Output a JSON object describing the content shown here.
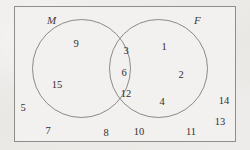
{
  "diagram": {
    "type": "venn-two-set",
    "background_color": "#eeecea",
    "paper_color": "#f3f1ef",
    "stroke_color": "#8a8a8a",
    "text_color": "#2f2f2f",
    "universal_set": {
      "shape": "rectangle",
      "label": ""
    },
    "sets": [
      {
        "id": "M",
        "label": "M",
        "position": "left",
        "label_placement": "outside-top-left"
      },
      {
        "id": "F",
        "label": "F",
        "position": "right",
        "label_placement": "outside-top-right"
      }
    ],
    "regions": {
      "m_only": {
        "name": "M only",
        "members": [
          "9",
          "15"
        ]
      },
      "intersection": {
        "name": "M and F",
        "members": [
          "3",
          "6",
          "12"
        ]
      },
      "f_only": {
        "name": "F only",
        "members": [
          "1",
          "2",
          "4"
        ]
      },
      "outside": {
        "name": "Neither M nor F",
        "members": [
          "5",
          "7",
          "8",
          "10",
          "11",
          "13",
          "14"
        ]
      }
    },
    "elements": [
      {
        "value": "9",
        "region": "m_only",
        "x": 76,
        "y": 44
      },
      {
        "value": "15",
        "region": "m_only",
        "x": 57,
        "y": 85
      },
      {
        "value": "3",
        "region": "intersection",
        "x": 126,
        "y": 51
      },
      {
        "value": "6",
        "region": "intersection",
        "x": 124,
        "y": 73
      },
      {
        "value": "12",
        "region": "intersection",
        "x": 126,
        "y": 94
      },
      {
        "value": "1",
        "region": "f_only",
        "x": 164,
        "y": 47
      },
      {
        "value": "2",
        "region": "f_only",
        "x": 181,
        "y": 75
      },
      {
        "value": "4",
        "region": "f_only",
        "x": 162,
        "y": 102
      },
      {
        "value": "5",
        "region": "outside",
        "x": 23,
        "y": 108
      },
      {
        "value": "7",
        "region": "outside",
        "x": 48,
        "y": 131
      },
      {
        "value": "8",
        "region": "outside",
        "x": 106,
        "y": 133
      },
      {
        "value": "10",
        "region": "outside",
        "x": 139,
        "y": 132
      },
      {
        "value": "11",
        "region": "outside",
        "x": 191,
        "y": 132
      },
      {
        "value": "13",
        "region": "outside",
        "x": 220,
        "y": 122
      },
      {
        "value": "14",
        "region": "outside",
        "x": 224,
        "y": 101
      }
    ]
  }
}
